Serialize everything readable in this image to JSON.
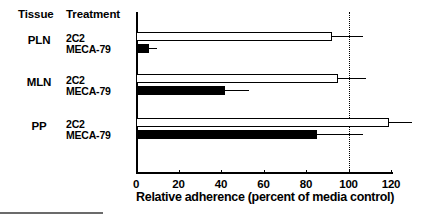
{
  "header": {
    "tissue_label": "Tissue",
    "treatment_label": "Treatment"
  },
  "axis": {
    "xlabel": "Relative adherence (percent of media control)",
    "ticks": [
      "0",
      "20",
      "40",
      "60",
      "80",
      "100",
      "120"
    ],
    "tick_values": [
      0,
      20,
      40,
      60,
      80,
      100,
      120
    ],
    "xmin": 0,
    "xmax": 120,
    "reference_line_value": 100,
    "reference_line_style": "dotted"
  },
  "legend_note": {
    "open_bar_treatment": "2C2",
    "filled_bar_treatment": "MECA-79"
  },
  "colors": {
    "open_bar_fill": "#ffffff",
    "open_bar_stroke": "#000000",
    "filled_bar_fill": "#000000",
    "axis": "#000000",
    "background": "#ffffff",
    "bottom_rule": "#6b6b6b"
  },
  "chart_data": {
    "type": "bar",
    "orientation": "horizontal",
    "title": "",
    "xlabel": "Relative adherence (percent of media control)",
    "ylabel": "",
    "xlim": [
      0,
      120
    ],
    "xticks": [
      0,
      20,
      40,
      60,
      80,
      100,
      120
    ],
    "grid": false,
    "legend_position": "none",
    "annotations": [
      {
        "type": "vline",
        "value": 100,
        "style": "dotted",
        "label": ""
      }
    ],
    "categories": [
      "PLN",
      "MLN",
      "PP"
    ],
    "series": [
      {
        "name": "2C2",
        "style": "open",
        "values": [
          92,
          95,
          119
        ],
        "errors_upper": [
          15,
          13,
          11
        ]
      },
      {
        "name": "MECA-79",
        "style": "filled",
        "values": [
          6,
          42,
          85
        ],
        "errors_upper": [
          4,
          11,
          22
        ]
      }
    ],
    "groups": [
      {
        "tissue": "PLN",
        "bars": [
          {
            "treatment": "2C2",
            "value": 92,
            "error_upper": 15,
            "style": "open"
          },
          {
            "treatment": "MECA-79",
            "value": 6,
            "error_upper": 4,
            "style": "filled"
          }
        ]
      },
      {
        "tissue": "MLN",
        "bars": [
          {
            "treatment": "2C2",
            "value": 95,
            "error_upper": 13,
            "style": "open"
          },
          {
            "treatment": "MECA-79",
            "value": 42,
            "error_upper": 11,
            "style": "filled"
          }
        ]
      },
      {
        "tissue": "PP",
        "bars": [
          {
            "treatment": "2C2",
            "value": 119,
            "error_upper": 11,
            "style": "open"
          },
          {
            "treatment": "MECA-79",
            "value": 85,
            "error_upper": 22,
            "style": "filled"
          }
        ]
      }
    ]
  }
}
